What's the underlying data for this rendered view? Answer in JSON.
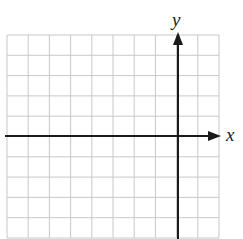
{
  "diagram": {
    "type": "coordinate-grid",
    "axes": {
      "x_label": "x",
      "y_label": "y"
    },
    "grid": {
      "columns": 10,
      "rows": 10,
      "line_color": "#c8c8c8",
      "axis_color": "#1a1a1a"
    },
    "origin_cell": {
      "col": 8,
      "row": 5
    }
  }
}
